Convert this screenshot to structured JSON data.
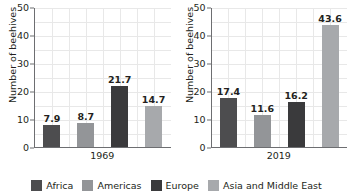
{
  "chart_data": {
    "type": "bar",
    "title": "",
    "xlabel": "",
    "ylabel": "Number of beehives",
    "ylim": [
      0,
      50
    ],
    "yticks": [
      0,
      10,
      20,
      30,
      40,
      50
    ],
    "grid": true,
    "legend_position": "bottom",
    "categories": [
      "1969",
      "2019"
    ],
    "series": [
      {
        "name": "Africa",
        "color": "#4d4d4f",
        "values": [
          7.9,
          17.4
        ]
      },
      {
        "name": "Americas",
        "color": "#939598",
        "values": [
          8.7,
          11.6
        ]
      },
      {
        "name": "Europe",
        "color": "#3a3a3c",
        "values": [
          21.7,
          16.2
        ]
      },
      {
        "name": "Asia and Middle East",
        "color": "#a7a9ac",
        "values": [
          14.7,
          43.6
        ]
      }
    ],
    "panels": [
      {
        "group_label": "1969",
        "ylabel": "Number of beehives",
        "bars": [
          {
            "series": "Africa",
            "value": 7.9,
            "label": "7.9",
            "color": "#4d4d4f"
          },
          {
            "series": "Americas",
            "value": 8.7,
            "label": "8.7",
            "color": "#939598"
          },
          {
            "series": "Europe",
            "value": 21.7,
            "label": "21.7",
            "color": "#3a3a3c"
          },
          {
            "series": "Asia and Middle East",
            "value": 14.7,
            "label": "14.7",
            "color": "#a7a9ac"
          }
        ],
        "yticks": [
          {
            "value": 50,
            "label": "50"
          },
          {
            "value": 40,
            "label": "40"
          },
          {
            "value": 30,
            "label": "30"
          },
          {
            "value": 20,
            "label": "20"
          },
          {
            "value": 10,
            "label": "10"
          },
          {
            "value": 0,
            "label": "0"
          }
        ]
      },
      {
        "group_label": "2019",
        "ylabel": "Number of beehives",
        "bars": [
          {
            "series": "Africa",
            "value": 17.4,
            "label": "17.4",
            "color": "#4d4d4f"
          },
          {
            "series": "Americas",
            "value": 11.6,
            "label": "11.6",
            "color": "#939598"
          },
          {
            "series": "Europe",
            "value": 16.2,
            "label": "16.2",
            "color": "#3a3a3c"
          },
          {
            "series": "Asia and Middle East",
            "value": 43.6,
            "label": "43.6",
            "color": "#a7a9ac"
          }
        ],
        "yticks": [
          {
            "value": 50,
            "label": "50"
          },
          {
            "value": 40,
            "label": "40"
          },
          {
            "value": 30,
            "label": "30"
          },
          {
            "value": 20,
            "label": "20"
          },
          {
            "value": 10,
            "label": "10"
          },
          {
            "value": 0,
            "label": "0"
          }
        ]
      }
    ],
    "legend": [
      {
        "label": "Africa",
        "color": "#4d4d4f"
      },
      {
        "label": "Americas",
        "color": "#939598"
      },
      {
        "label": "Europe",
        "color": "#3a3a3c"
      },
      {
        "label": "Asia and Middle East",
        "color": "#a7a9ac"
      }
    ]
  },
  "colors": {
    "axis": "#6d6e71",
    "grid": "#e8e8e8",
    "text": "#231f20",
    "background": "#ffffff"
  }
}
